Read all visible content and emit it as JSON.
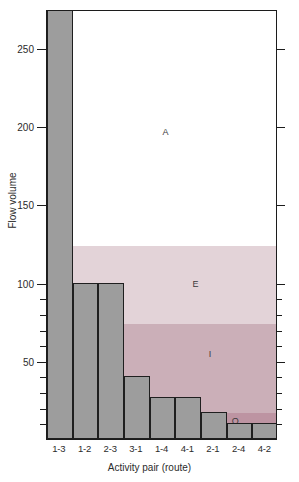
{
  "chart_data": {
    "type": "bar",
    "title": "",
    "xlabel": "Activity pair (route)",
    "ylabel": "Flow volume",
    "categories": [
      "1-3",
      "1-2",
      "2-3",
      "3-1",
      "1-4",
      "4-1",
      "2-1",
      "2-4",
      "4-2"
    ],
    "values": [
      275,
      100,
      100,
      40,
      27,
      27,
      17,
      10,
      10
    ],
    "ylim": [
      0,
      275
    ],
    "yticks": [
      50,
      100,
      150,
      200,
      250
    ],
    "ytick_labels": [
      "50",
      "100",
      "150",
      "200",
      "250"
    ],
    "minor_yticks": [
      10,
      20,
      30,
      40,
      60,
      70,
      80,
      90
    ],
    "grid": false,
    "legend": "none",
    "bar_color": "#9d9d9d",
    "bar_edge_color": "#1f1f1f",
    "note": "Last bar 1-3 exceeds the plotted axis range and is clipped at the top of the frame",
    "bands": [
      {
        "label": "A",
        "min": 125,
        "max": 275,
        "color": "#ffffff"
      },
      {
        "label": "E",
        "min": 75,
        "max": 125,
        "color": "#e3d3d8"
      },
      {
        "label": "I",
        "min": 18,
        "max": 75,
        "color": "#cbafb8"
      },
      {
        "label": "O",
        "min": 6,
        "max": 18,
        "color": "#bd94a2"
      },
      {
        "label": "U",
        "min": 0,
        "max": 6,
        "color": "#b4808f"
      }
    ]
  },
  "axis": {
    "y_title": "Flow volume",
    "x_title": "Activity pair (route)"
  }
}
